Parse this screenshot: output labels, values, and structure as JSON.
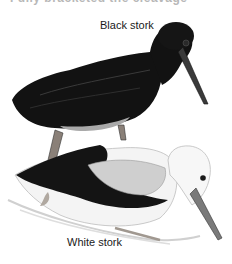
{
  "figure": {
    "top_cut_text": "Fully bracketed the cleavage",
    "labels": {
      "black_stork": "Black stork",
      "white_stork": "White stork"
    },
    "colors": {
      "black_plumage": "#111111",
      "white_plumage": "#f2f2f2",
      "grey_wing": "#c8c8c8",
      "beak_dark": "#3a3a3a",
      "beak_grey": "#7a7a7a",
      "leg": "#8a8078",
      "ground": "#d8d8d8"
    }
  }
}
